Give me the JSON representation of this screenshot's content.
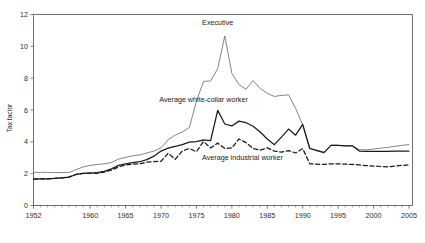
{
  "chart_data": {
    "type": "line",
    "title": "",
    "xlabel": "",
    "ylabel": "Tax factor",
    "xlim": [
      1952,
      2005.5
    ],
    "ylim": [
      0,
      12
    ],
    "grid": false,
    "legend_position": "inline-annotations",
    "xticks": [
      1952,
      1960,
      1965,
      1970,
      1975,
      1980,
      1985,
      1990,
      1995,
      2000,
      2005
    ],
    "xtick_labels": [
      "1952",
      "1960",
      "1965",
      "1970",
      "1975",
      "1980",
      "1985",
      "1990",
      "1995",
      "2000",
      "2005"
    ],
    "yticks": [
      0,
      2,
      4,
      6,
      8,
      10,
      12
    ],
    "ytick_labels": [
      "0",
      "2",
      "4",
      "6",
      "8",
      "10",
      "12"
    ],
    "minor_xticks_every": 1,
    "x": [
      1952,
      1953,
      1954,
      1955,
      1956,
      1957,
      1958,
      1959,
      1960,
      1961,
      1962,
      1963,
      1964,
      1965,
      1966,
      1967,
      1968,
      1969,
      1970,
      1971,
      1972,
      1973,
      1974,
      1975,
      1976,
      1977,
      1978,
      1979,
      1980,
      1981,
      1982,
      1983,
      1984,
      1985,
      1986,
      1987,
      1988,
      1989,
      1990,
      1991,
      1992,
      1993,
      1994,
      1995,
      1996,
      1997,
      1998,
      1999,
      2000,
      2001,
      2002,
      2003,
      2004,
      2005
    ],
    "series": [
      {
        "name": "Executive",
        "style": "thin-solid-grey",
        "color": "#6e6e6e",
        "label_x": 1978.0,
        "label_y": 11.35,
        "values": [
          2.08,
          2.08,
          2.08,
          2.07,
          2.07,
          2.07,
          2.25,
          2.42,
          2.52,
          2.58,
          2.62,
          2.7,
          2.92,
          3.02,
          3.12,
          3.18,
          3.3,
          3.42,
          3.62,
          4.12,
          4.42,
          4.62,
          4.9,
          6.55,
          7.8,
          7.82,
          8.6,
          10.65,
          8.3,
          7.6,
          7.3,
          7.85,
          7.35,
          7.05,
          6.85,
          6.92,
          6.95,
          6.1,
          5.05,
          3.6,
          3.48,
          3.35,
          3.8,
          3.78,
          3.75,
          3.75,
          3.5,
          3.5,
          3.55,
          3.6,
          3.65,
          3.72,
          3.78,
          3.82
        ]
      },
      {
        "name": "Average white-collar worker",
        "style": "thick-solid-black",
        "color": "#1a1a1a",
        "label_x": 1976.0,
        "label_y": 6.5,
        "values": [
          1.66,
          1.67,
          1.68,
          1.7,
          1.74,
          1.78,
          1.95,
          2.02,
          2.04,
          2.06,
          2.14,
          2.3,
          2.52,
          2.62,
          2.7,
          2.75,
          2.88,
          3.1,
          3.42,
          3.6,
          3.72,
          3.82,
          3.98,
          4.02,
          4.12,
          4.08,
          5.98,
          5.12,
          5.0,
          5.3,
          5.2,
          4.98,
          4.62,
          4.18,
          3.82,
          4.3,
          4.8,
          4.42,
          5.1,
          3.58,
          3.45,
          3.32,
          3.78,
          3.78,
          3.75,
          3.75,
          3.42,
          3.4,
          3.4,
          3.4,
          3.4,
          3.42,
          3.42,
          3.42
        ]
      },
      {
        "name": "Average industrial worker",
        "style": "dashed-black",
        "color": "#1a1a1a",
        "label_x": 1981.5,
        "label_y": 2.88,
        "values": [
          1.66,
          1.67,
          1.68,
          1.7,
          1.74,
          1.78,
          1.95,
          2.02,
          2.04,
          2.02,
          2.1,
          2.22,
          2.42,
          2.55,
          2.6,
          2.62,
          2.72,
          2.76,
          2.78,
          3.28,
          2.9,
          3.42,
          3.58,
          3.38,
          4.02,
          3.62,
          3.92,
          3.58,
          3.62,
          4.18,
          3.95,
          3.58,
          3.48,
          3.62,
          3.42,
          3.35,
          3.45,
          3.3,
          3.58,
          2.62,
          2.6,
          2.58,
          2.62,
          2.62,
          2.6,
          2.58,
          2.55,
          2.5,
          2.48,
          2.45,
          2.42,
          2.48,
          2.52,
          2.55
        ]
      }
    ]
  }
}
